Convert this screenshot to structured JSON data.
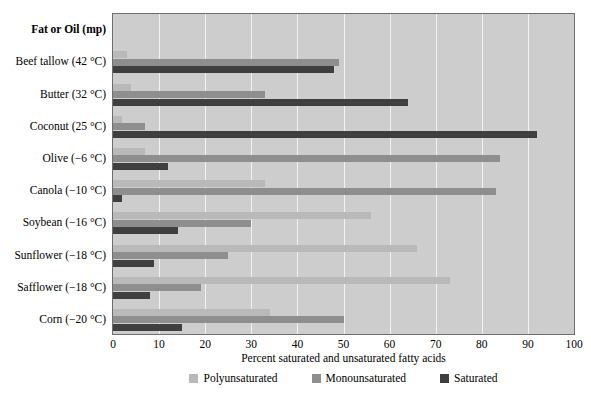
{
  "chart_data": {
    "type": "bar",
    "orientation": "horizontal",
    "title": "",
    "xlabel": "Percent saturated and unsaturated fatty acids",
    "ylabel": "Fat or Oil (mp)",
    "xlim": [
      0,
      100
    ],
    "xticks": [
      0,
      10,
      20,
      30,
      40,
      50,
      60,
      70,
      80,
      90,
      100
    ],
    "grid": true,
    "legend_position": "bottom",
    "categories": [
      "Beef tallow (42 °C)",
      "Butter (32 °C)",
      "Coconut (25 °C)",
      "Olive (−6 °C)",
      "Canola (−10 °C)",
      "Soybean (−16 °C)",
      "Sunflower (−18 °C)",
      "Safflower (−18 °C)",
      "Corn (−20 °C)"
    ],
    "series": [
      {
        "name": "Polyunsaturated",
        "color": "#b9b9b9",
        "values": [
          3,
          4,
          2,
          7,
          33,
          56,
          66,
          73,
          34
        ]
      },
      {
        "name": "Monounsaturated",
        "color": "#8e8e8e",
        "values": [
          49,
          33,
          7,
          84,
          83,
          30,
          25,
          19,
          50
        ]
      },
      {
        "name": "Saturated",
        "color": "#3f3f3f",
        "values": [
          48,
          64,
          92,
          12,
          2,
          14,
          9,
          8,
          15
        ]
      }
    ]
  },
  "colors": {
    "plot_background": "#cdcdcd",
    "gridline": "#f2f2f2",
    "frame": "#6e6e6e",
    "polyunsaturated": "#b9b9b9",
    "monounsaturated": "#8e8e8e",
    "saturated": "#3f3f3f"
  }
}
